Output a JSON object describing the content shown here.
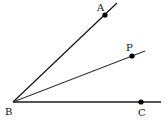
{
  "diagram": {
    "type": "angle-bisector-figure",
    "vertex": {
      "label": "B",
      "x": 13,
      "y": 102,
      "label_x": 5,
      "label_y": 115
    },
    "rays": [
      {
        "name": "BA",
        "x2": 117,
        "y2": 3,
        "point": {
          "label": "A",
          "x": 105,
          "y": 15,
          "label_x": 97,
          "label_y": 11
        }
      },
      {
        "name": "BP",
        "x2": 145,
        "y2": 51,
        "point": {
          "label": "P",
          "x": 132,
          "y": 56,
          "label_x": 126,
          "label_y": 51
        }
      },
      {
        "name": "BC",
        "x2": 161,
        "y2": 102,
        "point": {
          "label": "C",
          "x": 141,
          "y": 102,
          "label_x": 138,
          "label_y": 116
        }
      }
    ],
    "colors": {
      "line": "#1a1a1a",
      "ray_bp": "#333333",
      "point": "#000000"
    }
  }
}
